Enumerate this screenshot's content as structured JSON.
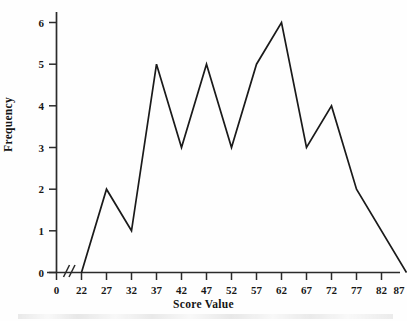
{
  "chart_data": {
    "type": "line",
    "title": "",
    "subtitle": "",
    "xlabel": "Score Value",
    "ylabel": "Frequency",
    "x": [
      22,
      27,
      32,
      37,
      42,
      47,
      52,
      57,
      62,
      67,
      72,
      77,
      87
    ],
    "values": [
      0,
      2,
      1,
      5,
      3,
      5,
      3,
      5,
      6,
      3,
      4,
      2,
      0
    ],
    "series": [
      {
        "name": "Frequency",
        "values": [
          0,
          2,
          1,
          5,
          3,
          5,
          3,
          5,
          6,
          3,
          4,
          2,
          0
        ]
      }
    ],
    "xticks": [
      "0",
      "22",
      "27",
      "32",
      "37",
      "42",
      "47",
      "52",
      "57",
      "62",
      "67",
      "72",
      "77",
      "82",
      "87"
    ],
    "xtick_values": [
      0,
      22,
      27,
      32,
      37,
      42,
      47,
      52,
      57,
      62,
      67,
      72,
      77,
      82,
      87
    ],
    "yticks": [
      "0",
      "1",
      "2",
      "3",
      "4",
      "5",
      "6"
    ],
    "ytick_values": [
      0,
      1,
      2,
      3,
      4,
      5,
      6
    ],
    "xlim": [
      0,
      87
    ],
    "ylim": [
      0,
      6
    ],
    "grid": false,
    "legend": false,
    "legend_position": "none",
    "axis_break": "//",
    "axis_break_note": "x-axis break between 0 and 22",
    "line_color": "#1a1a1a",
    "axis_color": "#2b2b2b",
    "background_color": "#ffffff",
    "marker": "none"
  },
  "figure": {
    "y_axis_title": "Frequency",
    "x_axis_title": "Score Value",
    "x_axis_break_glyph": "//"
  }
}
